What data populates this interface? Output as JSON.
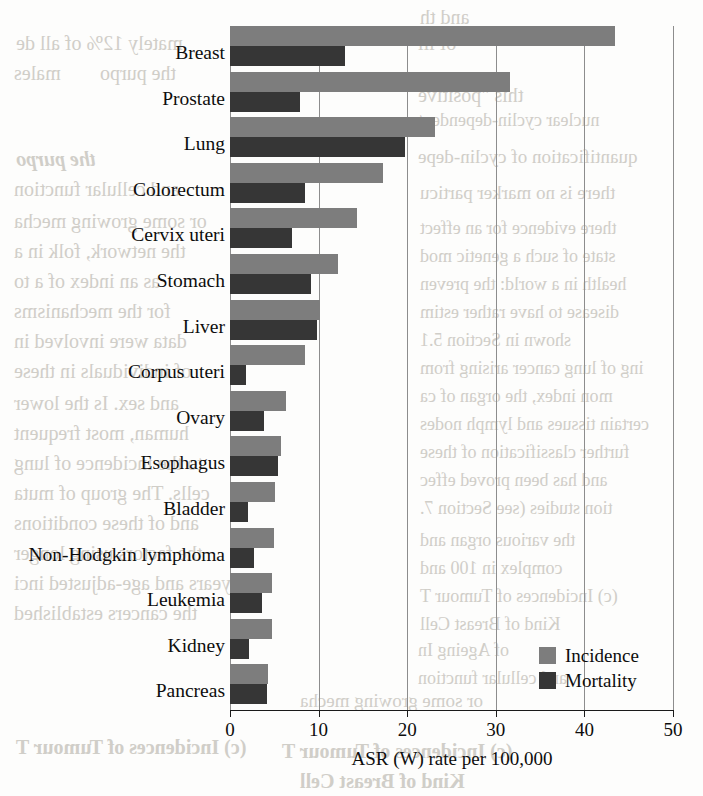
{
  "chart_data": {
    "type": "bar",
    "orientation": "horizontal",
    "title": "",
    "xlabel": "ASR (W) rate per 100,000",
    "ylabel": "",
    "xlim": [
      0,
      50
    ],
    "xticks": [
      0,
      10,
      20,
      30,
      40,
      50
    ],
    "xtick_labels": [
      "0",
      "10",
      "20",
      "30",
      "40",
      "50"
    ],
    "grid": "vertical gridlines at each x tick",
    "legend_position": "bottom-right inside plot area",
    "categories": [
      "Breast",
      "Prostate",
      "Lung",
      "Colorectum",
      "Cervix uteri",
      "Stomach",
      "Liver",
      "Corpus uteri",
      "Ovary",
      "Esophagus",
      "Bladder",
      "Non-Hodgkin lymphoma",
      "Leukemia",
      "Kidney",
      "Pancreas"
    ],
    "series": [
      {
        "name": "Incidence",
        "color": "#7d7d7d",
        "values": [
          43.4,
          31.6,
          23.1,
          17.3,
          14.3,
          12.2,
          10.2,
          8.5,
          6.3,
          5.8,
          5.1,
          5.0,
          4.7,
          4.7,
          4.3
        ]
      },
      {
        "name": "Mortality",
        "color": "#363636",
        "values": [
          13.0,
          7.9,
          19.8,
          8.5,
          7.0,
          9.1,
          9.8,
          1.8,
          3.8,
          5.4,
          2.0,
          2.7,
          3.6,
          2.1,
          4.2
        ]
      }
    ]
  },
  "legend": {
    "items": [
      {
        "label": "Incidence",
        "color": "#7d7d7d"
      },
      {
        "label": "Mortality",
        "color": "#363636"
      }
    ]
  },
  "bleed_text": [
    "and th",
    "mately 12% of all de",
    "of ill",
    "males",
    "the purpo",
    "this \"positive",
    "nuclear cyclin-dependent",
    "quantification of cyclin-depe",
    "there is no marker particu",
    "there evidence for an effect",
    "state of such a genetic mod",
    "health in a world: the preven",
    "disease to have rather estim",
    "shown in Section 5.1",
    "ing of lung cancer arising from",
    "mon index, the organ of ca",
    "certain tissues and lymph nodes",
    "further classification of these",
    "and has been proved effec",
    "tion studies (see Section 7.",
    "the various organ and",
    "complex in 100 and",
    "(c) Incidences of Tumour T",
    "Kind of Breast Cell",
    "of Ageing In",
    "and cellular function",
    "or some growing mecha",
    "the network, folk in a",
    "as an index of a to",
    "for the mechanisms",
    "data were involved in",
    "of individuals in these",
    "and sex. Is the lower",
    "human, most frequent",
    "to the incidence of lung",
    "cells. The group of muta",
    "and of these conditions",
    "the factors using longer",
    "in years and age-adjusted inci",
    "the cancers established"
  ]
}
